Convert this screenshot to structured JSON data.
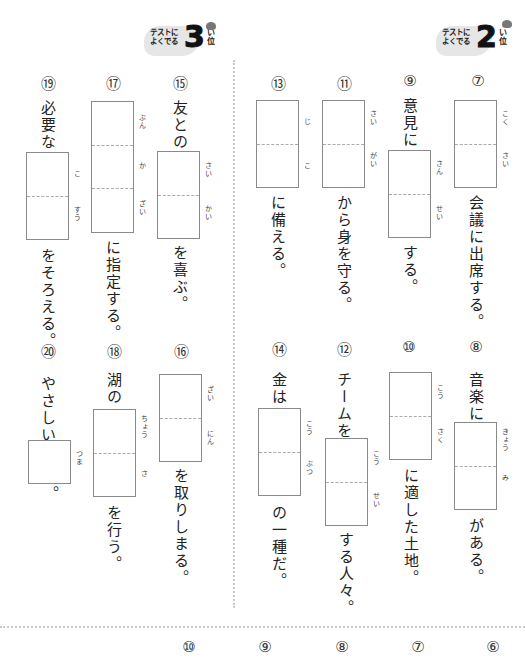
{
  "badges": [
    {
      "id": "badge-rank3",
      "line1": "テストに",
      "line2": "よくでる",
      "number": "3",
      "rank_reading": "い",
      "rank": "位"
    },
    {
      "id": "badge-rank2",
      "line1": "テストに",
      "line2": "よくでる",
      "number": "2",
      "rank_reading": "い",
      "rank": "位"
    }
  ],
  "questions": [
    {
      "num": "⑦",
      "before": "",
      "readings": [
        "こく",
        "さい"
      ],
      "after": "会議に出席する。"
    },
    {
      "num": "⑨",
      "before": "意見に",
      "readings": [
        "さん",
        "せい"
      ],
      "after": "する。"
    },
    {
      "num": "⑪",
      "before": "",
      "readings": [
        "さい",
        "がい"
      ],
      "after": "から身を守る。"
    },
    {
      "num": "⑬",
      "before": "",
      "readings": [
        "じ",
        "こ"
      ],
      "after": "に備える。"
    },
    {
      "num": "⑮",
      "before": "友との",
      "readings": [
        "さい",
        "かい"
      ],
      "after": "を喜ぶ。"
    },
    {
      "num": "⑰",
      "before": "",
      "readings": [
        "ぶん",
        "か",
        "ざい"
      ],
      "after": "に指定する。"
    },
    {
      "num": "⑲",
      "before": "必要な",
      "readings": [
        "こ",
        "すう"
      ],
      "after": "をそろえる。"
    },
    {
      "num": "⑧",
      "before": "音楽に",
      "readings": [
        "きょう",
        "み"
      ],
      "after": "がある。"
    },
    {
      "num": "⑩",
      "before": "",
      "readings": [
        "こう",
        "さく"
      ],
      "after": "に適した土地。"
    },
    {
      "num": "⑫",
      "before": "チームを",
      "readings": [
        "こう",
        "せい"
      ],
      "after": "する人々。"
    },
    {
      "num": "⑭",
      "before": "金は",
      "readings": [
        "こう",
        "ぶつ"
      ],
      "after": "の一種だ。"
    },
    {
      "num": "⑯",
      "before": "",
      "readings": [
        "ざい",
        "にん"
      ],
      "after": "を取りしまる。"
    },
    {
      "num": "⑱",
      "before": "湖の",
      "readings": [
        "ちょう",
        "さ"
      ],
      "after": "を行う。"
    },
    {
      "num": "⑳",
      "before": "やさしい",
      "readings": [
        "つま"
      ],
      "after": "。"
    }
  ],
  "bottom_numbers": [
    "⑩",
    "⑨",
    "⑧",
    "⑦",
    "⑥"
  ]
}
